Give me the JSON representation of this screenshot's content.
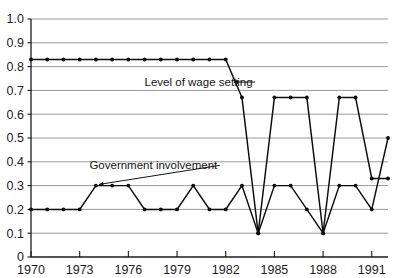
{
  "chart_data": {
    "type": "line",
    "title": "",
    "xlabel": "",
    "ylabel": "",
    "xlim": [
      1970,
      1992
    ],
    "ylim": [
      0,
      1.0
    ],
    "grid": true,
    "legend_position": "inline-annotations",
    "x": [
      1970,
      1971,
      1972,
      1973,
      1974,
      1975,
      1976,
      1977,
      1978,
      1979,
      1980,
      1981,
      1982,
      1983,
      1984,
      1985,
      1986,
      1987,
      1988,
      1989,
      1990,
      1991,
      1992
    ],
    "x_tick_labels": [
      "1970",
      "1973",
      "1976",
      "1979",
      "1982",
      "1985",
      "1988",
      "1991"
    ],
    "x_tick_values": [
      1970,
      1973,
      1976,
      1979,
      1982,
      1985,
      1988,
      1991
    ],
    "y_tick_labels": [
      "0",
      "0.1",
      "0.2",
      "0.3",
      "0.4",
      "0.5",
      "0.6",
      "0.7",
      "0.8",
      "0.9",
      "1.0"
    ],
    "y_tick_values": [
      0,
      0.1,
      0.2,
      0.3,
      0.4,
      0.5,
      0.6,
      0.7,
      0.8,
      0.9,
      1.0
    ],
    "series": [
      {
        "name": "Level of wage setting",
        "values": [
          0.83,
          0.83,
          0.83,
          0.83,
          0.83,
          0.83,
          0.83,
          0.83,
          0.83,
          0.83,
          0.83,
          0.83,
          0.83,
          0.67,
          0.1,
          0.67,
          0.67,
          0.67,
          0.1,
          0.67,
          0.67,
          0.33,
          0.33
        ]
      },
      {
        "name": "Government involvement",
        "values": [
          0.2,
          0.2,
          0.2,
          0.2,
          0.3,
          0.3,
          0.3,
          0.2,
          0.2,
          0.2,
          0.3,
          0.2,
          0.2,
          0.3,
          0.1,
          0.3,
          0.3,
          0.2,
          0.1,
          0.3,
          0.3,
          0.2,
          0.5
        ]
      }
    ],
    "annotations": [
      {
        "text": "Level of wage setting",
        "x": 1977.0,
        "y": 0.735,
        "arrow_to_x": 1982.5,
        "arrow_to_y": 0.735
      },
      {
        "text": "Government involvement",
        "x": 1973.6,
        "y": 0.385,
        "arrow_to_x": 1974.2,
        "arrow_to_y": 0.305
      }
    ]
  }
}
